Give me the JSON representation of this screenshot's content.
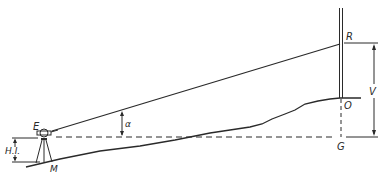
{
  "diagram": {
    "stroke_color": "#2a2a2a",
    "background_color": "#ffffff",
    "labels": {
      "instrument": "E",
      "height_of_instrument": "H.I.",
      "ground_station": "M",
      "angle": "α",
      "rod_reading": "R",
      "rod_base": "O",
      "level_point": "G",
      "vertical_distance": "V"
    }
  }
}
